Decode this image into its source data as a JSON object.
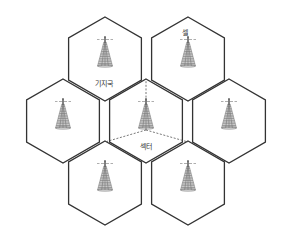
{
  "diagram": {
    "type": "cellular-network-hexagon-layout",
    "colors": {
      "outline": "#333333",
      "dashed_sector": "#555555",
      "tower": "#777777",
      "label": "#333333",
      "background": "#ffffff"
    },
    "hex_radius": 42,
    "cells": [
      {
        "id": "top-left",
        "cx": 105,
        "cy": 59,
        "has_tower": true
      },
      {
        "id": "top-right",
        "cx": 188,
        "cy": 59,
        "has_tower": true
      },
      {
        "id": "middle-left",
        "cx": 63,
        "cy": 121,
        "has_tower": true
      },
      {
        "id": "center",
        "cx": 146,
        "cy": 121,
        "has_tower": true,
        "sectored": true
      },
      {
        "id": "middle-right",
        "cx": 229,
        "cy": 121,
        "has_tower": true
      },
      {
        "id": "bottom-left",
        "cx": 105,
        "cy": 183,
        "has_tower": true
      },
      {
        "id": "bottom-right",
        "cx": 188,
        "cy": 183,
        "has_tower": true
      }
    ],
    "sector_lines": [
      {
        "from": [
          146,
          130
        ],
        "to": [
          146,
          80
        ]
      },
      {
        "from": [
          146,
          130
        ],
        "to": [
          105,
          142
        ]
      },
      {
        "from": [
          146,
          130
        ],
        "to": [
          188,
          142
        ]
      }
    ],
    "labels": {
      "base_station": {
        "text": "기지국",
        "x": 104,
        "y": 84
      },
      "cell": {
        "text": "셀",
        "x": 185,
        "y": 33
      },
      "sector": {
        "text": "섹터",
        "x": 146,
        "y": 147
      }
    }
  }
}
